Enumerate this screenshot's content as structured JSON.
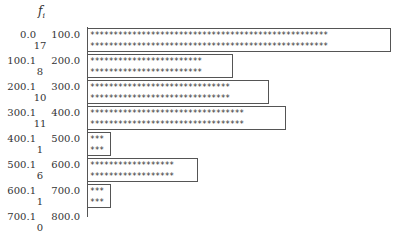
{
  "chart_data": {
    "type": "bar",
    "orientation": "horizontal",
    "title": "",
    "ylabel": "f_i",
    "symbol": "*",
    "stars_per_unit": 3,
    "categories": [
      "0.0–100.0",
      "100.1–200.0",
      "200.1–300.0",
      "300.1–400.0",
      "400.1–500.0",
      "500.1–600.0",
      "600.1–700.0",
      "700.1–800.0"
    ],
    "classes": [
      {
        "lower": "0.0",
        "upper": "100.0",
        "frequency": 17
      },
      {
        "lower": "100.1",
        "upper": "200.0",
        "frequency": 8
      },
      {
        "lower": "200.1",
        "upper": "300.0",
        "frequency": 10
      },
      {
        "lower": "300.1",
        "upper": "400.0",
        "frequency": 11
      },
      {
        "lower": "400.1",
        "upper": "500.0",
        "frequency": 1
      },
      {
        "lower": "500.1",
        "upper": "600.0",
        "frequency": 6
      },
      {
        "lower": "600.1",
        "upper": "700.0",
        "frequency": 1
      },
      {
        "lower": "700.1",
        "upper": "800.0",
        "frequency": 0
      }
    ],
    "values": [
      17,
      8,
      10,
      11,
      1,
      6,
      1,
      0
    ]
  },
  "labels": {
    "fi_main": "f",
    "fi_sub": "i"
  }
}
